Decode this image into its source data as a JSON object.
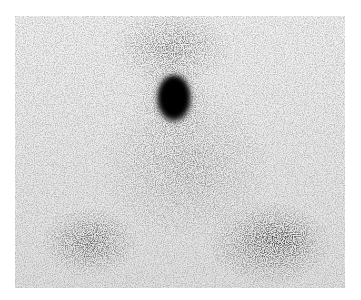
{
  "image": {
    "kind": "grayscale nuclear medicine scintigraphy scan",
    "background_color": "#ffffff",
    "field_bounds": {
      "x": 15,
      "y": 16,
      "width": 330,
      "height": 272
    },
    "field_base_color": "#e6e6e6",
    "ink_color": "#111111",
    "regions": [
      {
        "name": "focal-hotspot",
        "cx": 174,
        "cy": 98,
        "rx": 17,
        "ry": 24,
        "intensity": 1.0
      },
      {
        "name": "upper-neck-diffuse",
        "cx": 172,
        "cy": 45,
        "rx": 55,
        "ry": 35,
        "intensity": 0.35
      },
      {
        "name": "central-diffuse",
        "cx": 185,
        "cy": 165,
        "rx": 75,
        "ry": 70,
        "intensity": 0.2
      },
      {
        "name": "lower-left-uptake",
        "cx": 88,
        "cy": 242,
        "rx": 38,
        "ry": 26,
        "intensity": 0.5
      },
      {
        "name": "lower-right-uptake",
        "cx": 272,
        "cy": 243,
        "rx": 48,
        "ry": 32,
        "intensity": 0.6
      }
    ]
  }
}
